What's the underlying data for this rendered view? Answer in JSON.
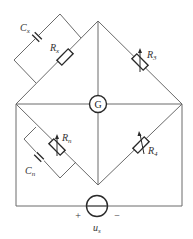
{
  "diagram": {
    "type": "AC bridge circuit",
    "components": {
      "Cx": {
        "label": "C",
        "sub": "x",
        "kind": "capacitor"
      },
      "Rx": {
        "label": "R",
        "sub": "x",
        "kind": "resistor"
      },
      "R3": {
        "label": "R",
        "sub": "3",
        "kind": "variable-resistor"
      },
      "Rn": {
        "label": "R",
        "sub": "n",
        "kind": "variable-resistor"
      },
      "Cn": {
        "label": "C",
        "sub": "n",
        "kind": "capacitor"
      },
      "R4": {
        "label": "R",
        "sub": "4",
        "kind": "variable-resistor"
      },
      "G": {
        "label": "G",
        "kind": "galvanometer"
      },
      "us": {
        "label": "u",
        "sub": "s",
        "kind": "voltage-source",
        "plus": "+",
        "minus": "−"
      }
    },
    "colors": {
      "wire": "#6a6a6a",
      "component": "#2a2a2a",
      "background": "#ffffff"
    }
  }
}
